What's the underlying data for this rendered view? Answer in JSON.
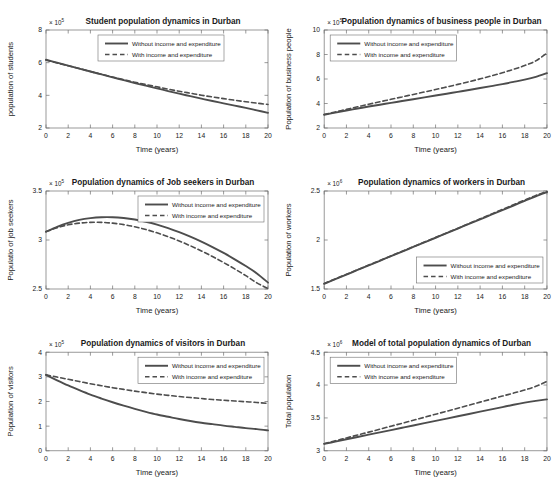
{
  "figure": {
    "background": "#ffffff",
    "line_color": "#4d4d4d",
    "axis_color": "#6e6e6e",
    "text_color": "#1a1a1a",
    "xlabel": "Time (years)",
    "xticks": [
      "0",
      "2",
      "4",
      "6",
      "8",
      "10",
      "12",
      "14",
      "16",
      "18",
      "20"
    ],
    "legend": {
      "solid_label": "Without income and expenditure",
      "dashed_label": "With income and expenditure"
    }
  },
  "chart_data": [
    {
      "type": "line",
      "id": "students",
      "title": "Student population dynamics in Durban",
      "xlabel": "Time (years)",
      "ylabel": "population of students",
      "exponent_text": "× 10",
      "exponent_power": "5",
      "xlim": [
        0,
        20
      ],
      "ylim": [
        2,
        8
      ],
      "xticks": [
        0,
        2,
        4,
        6,
        8,
        10,
        12,
        14,
        16,
        18,
        20
      ],
      "yticks": [
        2,
        4,
        6,
        8
      ],
      "ytick_labels": [
        "2",
        "4",
        "6",
        "8"
      ],
      "grid": false,
      "legend_position": "top-center",
      "x": [
        0,
        1,
        2,
        3,
        4,
        5,
        6,
        7,
        8,
        9,
        10,
        11,
        12,
        13,
        14,
        15,
        16,
        17,
        18,
        19,
        20
      ],
      "series": [
        {
          "name": "Without income and expenditure",
          "style": "solid",
          "values": [
            6.18,
            6.0,
            5.82,
            5.64,
            5.46,
            5.28,
            5.1,
            4.93,
            4.75,
            4.59,
            4.43,
            4.26,
            4.1,
            3.95,
            3.8,
            3.65,
            3.51,
            3.37,
            3.23,
            3.08,
            2.93
          ]
        },
        {
          "name": "With income and expenditure",
          "style": "dashed",
          "values": [
            6.16,
            5.98,
            5.81,
            5.64,
            5.46,
            5.29,
            5.12,
            4.96,
            4.8,
            4.66,
            4.52,
            4.38,
            4.25,
            4.13,
            4.01,
            3.9,
            3.8,
            3.7,
            3.61,
            3.52,
            3.44
          ]
        }
      ]
    },
    {
      "type": "line",
      "id": "business-people",
      "title": "Population dynamics of business people in Durban",
      "xlabel": "Time (years)",
      "ylabel": "Population of business people",
      "exponent_text": "× 10",
      "exponent_power": "5",
      "xlim": [
        0,
        20
      ],
      "ylim": [
        2,
        10
      ],
      "xticks": [
        0,
        2,
        4,
        6,
        8,
        10,
        12,
        14,
        16,
        18,
        20
      ],
      "yticks": [
        2,
        4,
        6,
        8,
        10
      ],
      "ytick_labels": [
        "2",
        "4",
        "6",
        "8",
        "10"
      ],
      "grid": false,
      "legend_position": "top-left",
      "x": [
        0,
        1,
        2,
        3,
        4,
        5,
        6,
        7,
        8,
        9,
        10,
        11,
        12,
        13,
        14,
        15,
        16,
        17,
        18,
        19,
        20
      ],
      "series": [
        {
          "name": "Without income and expenditure",
          "style": "solid",
          "values": [
            3.08,
            3.26,
            3.43,
            3.59,
            3.75,
            3.9,
            4.05,
            4.2,
            4.35,
            4.5,
            4.65,
            4.8,
            4.95,
            5.1,
            5.26,
            5.42,
            5.58,
            5.76,
            5.95,
            6.18,
            6.48
          ]
        },
        {
          "name": "With income and expenditure",
          "style": "dashed",
          "values": [
            3.1,
            3.31,
            3.52,
            3.73,
            3.94,
            4.14,
            4.34,
            4.54,
            4.74,
            4.94,
            5.14,
            5.35,
            5.56,
            5.78,
            6.01,
            6.25,
            6.51,
            6.79,
            7.1,
            7.48,
            8.12
          ]
        }
      ]
    },
    {
      "type": "line",
      "id": "job-seekers",
      "title": "Population dynamics of Job seekers in Durban",
      "xlabel": "Time (years)",
      "ylabel": "Populatio of job seekers",
      "exponent_text": "× 10",
      "exponent_power": "5",
      "xlim": [
        0,
        20
      ],
      "ylim": [
        2.5,
        3.5
      ],
      "xticks": [
        0,
        2,
        4,
        6,
        8,
        10,
        12,
        14,
        16,
        18,
        20
      ],
      "yticks": [
        2.5,
        3,
        3.5
      ],
      "ytick_labels": [
        "2.5",
        "3",
        "3.5"
      ],
      "grid": false,
      "legend_position": "top-right",
      "x": [
        0,
        1,
        2,
        3,
        4,
        5,
        6,
        7,
        8,
        9,
        10,
        11,
        12,
        13,
        14,
        15,
        16,
        17,
        18,
        19,
        20
      ],
      "series": [
        {
          "name": "Without income and expenditure",
          "style": "solid",
          "values": [
            3.085,
            3.135,
            3.175,
            3.205,
            3.223,
            3.232,
            3.232,
            3.224,
            3.209,
            3.186,
            3.157,
            3.122,
            3.081,
            3.035,
            2.984,
            2.928,
            2.868,
            2.803,
            2.734,
            2.659,
            2.565
          ]
        },
        {
          "name": "With income and expenditure",
          "style": "dashed",
          "values": [
            3.085,
            3.125,
            3.155,
            3.172,
            3.18,
            3.18,
            3.172,
            3.157,
            3.135,
            3.107,
            3.073,
            3.034,
            2.99,
            2.941,
            2.888,
            2.831,
            2.77,
            2.705,
            2.636,
            2.562,
            2.505
          ]
        }
      ]
    },
    {
      "type": "line",
      "id": "workers",
      "title": "Population dynamics of workers in Durban",
      "xlabel": "Time (years)",
      "ylabel": "Population of workers",
      "exponent_text": "× 10",
      "exponent_power": "6",
      "xlim": [
        0,
        20
      ],
      "ylim": [
        1.5,
        2.5
      ],
      "xticks": [
        0,
        2,
        4,
        6,
        8,
        10,
        12,
        14,
        16,
        18,
        20
      ],
      "yticks": [
        1.5,
        2,
        2.5
      ],
      "ytick_labels": [
        "1.5",
        "2",
        "2.5"
      ],
      "grid": false,
      "legend_position": "bottom-right",
      "x": [
        0,
        1,
        2,
        3,
        4,
        5,
        6,
        7,
        8,
        9,
        10,
        11,
        12,
        13,
        14,
        15,
        16,
        17,
        18,
        19,
        20
      ],
      "series": [
        {
          "name": "Without income and expenditure",
          "style": "solid",
          "values": [
            1.553,
            1.6,
            1.647,
            1.694,
            1.741,
            1.788,
            1.835,
            1.882,
            1.929,
            1.976,
            2.023,
            2.07,
            2.117,
            2.164,
            2.211,
            2.258,
            2.305,
            2.352,
            2.399,
            2.446,
            2.489
          ]
        },
        {
          "name": "With income and expenditure",
          "style": "dashed",
          "values": [
            1.556,
            1.603,
            1.65,
            1.697,
            1.744,
            1.791,
            1.838,
            1.885,
            1.932,
            1.979,
            2.026,
            2.073,
            2.12,
            2.168,
            2.216,
            2.264,
            2.312,
            2.36,
            2.408,
            2.455,
            2.496
          ]
        }
      ]
    },
    {
      "type": "line",
      "id": "visitors",
      "title": "Population dynamics of visitors in Durban",
      "xlabel": "Time (years)",
      "ylabel": "Population of visitors",
      "exponent_text": "× 10",
      "exponent_power": "5",
      "xlim": [
        0,
        20
      ],
      "ylim": [
        0,
        4
      ],
      "xticks": [
        0,
        2,
        4,
        6,
        8,
        10,
        12,
        14,
        16,
        18,
        20
      ],
      "yticks": [
        0,
        1,
        2,
        3,
        4
      ],
      "ytick_labels": [
        "0",
        "1",
        "2",
        "3",
        "4"
      ],
      "grid": false,
      "legend_position": "top-right",
      "x": [
        0,
        1,
        2,
        3,
        4,
        5,
        6,
        7,
        8,
        9,
        10,
        11,
        12,
        13,
        14,
        15,
        16,
        17,
        18,
        19,
        20
      ],
      "series": [
        {
          "name": "Without income and expenditure",
          "style": "solid",
          "values": [
            3.08,
            2.86,
            2.65,
            2.46,
            2.28,
            2.12,
            1.97,
            1.83,
            1.7,
            1.58,
            1.47,
            1.38,
            1.29,
            1.21,
            1.14,
            1.08,
            1.02,
            0.97,
            0.92,
            0.88,
            0.83
          ]
        },
        {
          "name": "With income and expenditure",
          "style": "dashed",
          "values": [
            3.08,
            2.99,
            2.9,
            2.81,
            2.72,
            2.64,
            2.56,
            2.49,
            2.42,
            2.36,
            2.3,
            2.25,
            2.2,
            2.16,
            2.12,
            2.08,
            2.05,
            2.02,
            1.99,
            1.96,
            1.92
          ]
        }
      ]
    },
    {
      "type": "line",
      "id": "total-population",
      "title": "Model of total population dynamics of Durban",
      "xlabel": "Time (years)",
      "ylabel": "Total population",
      "exponent_text": "× 10",
      "exponent_power": "6",
      "xlim": [
        0,
        20
      ],
      "ylim": [
        3,
        4.5
      ],
      "xticks": [
        0,
        2,
        4,
        6,
        8,
        10,
        12,
        14,
        16,
        18,
        20
      ],
      "yticks": [
        3,
        3.5,
        4,
        4.5
      ],
      "ytick_labels": [
        "3",
        "3.5",
        "4",
        "4.5"
      ],
      "grid": false,
      "legend_position": "top-left",
      "x": [
        0,
        1,
        2,
        3,
        4,
        5,
        6,
        7,
        8,
        9,
        10,
        11,
        12,
        13,
        14,
        15,
        16,
        17,
        18,
        19,
        20
      ],
      "series": [
        {
          "name": "Without income and expenditure",
          "style": "solid",
          "values": [
            3.105,
            3.14,
            3.175,
            3.21,
            3.245,
            3.28,
            3.315,
            3.35,
            3.385,
            3.42,
            3.455,
            3.49,
            3.525,
            3.56,
            3.595,
            3.63,
            3.665,
            3.7,
            3.732,
            3.76,
            3.782
          ]
        },
        {
          "name": "With income and expenditure",
          "style": "dashed",
          "values": [
            3.108,
            3.152,
            3.196,
            3.24,
            3.284,
            3.329,
            3.374,
            3.419,
            3.464,
            3.51,
            3.556,
            3.602,
            3.648,
            3.694,
            3.74,
            3.786,
            3.832,
            3.878,
            3.925,
            3.98,
            4.055
          ]
        }
      ]
    }
  ]
}
